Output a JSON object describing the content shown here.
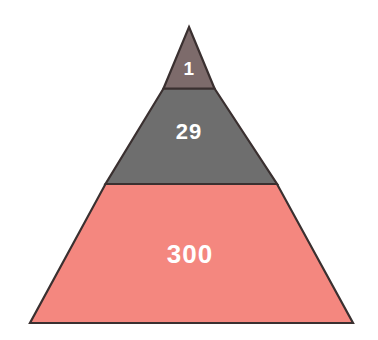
{
  "chart_data": {
    "type": "pie",
    "chart_variant": "pyramid",
    "title": "",
    "subtitle": "",
    "xlabel": "",
    "ylabel": "",
    "legend": [],
    "grid": false,
    "categories": [
      "top",
      "middle",
      "bottom"
    ],
    "values": [
      1,
      29,
      300
    ],
    "labels": [
      "1",
      "29",
      "300"
    ],
    "series": [
      {
        "name": "pyramid_tiers",
        "values": [
          1,
          29,
          300
        ]
      }
    ],
    "tiers": [
      {
        "id": "tier-top",
        "label": "1",
        "value": 1,
        "fill": "#7d6b6b",
        "stroke": "#3a3030",
        "points": "189,27 214.5,88.5 163.5,88.5",
        "label_x": 189,
        "label_y": 70
      },
      {
        "id": "tier-middle",
        "label": "29",
        "value": 29,
        "fill": "#6e6e6e",
        "stroke": "#3a3030",
        "points": "163.5,88.5 214.5,88.5 277,184 105.5,184",
        "label_x": 189,
        "label_y": 133
      },
      {
        "id": "tier-bottom",
        "label": "300",
        "value": 300,
        "fill": "#f4877f",
        "stroke": "#3a3030",
        "points": "105.5,184 277,184 353,323 30,323",
        "label_x": 190,
        "label_y": 256
      }
    ],
    "geometry": {
      "apex_x": 189,
      "apex_y": 27,
      "base_left_x": 30,
      "base_right_x": 353,
      "base_y": 323,
      "divider_1_y": 88.5,
      "divider_2_y": 184
    },
    "colors": {
      "background": "#ffffff",
      "outline": "#3a3030",
      "tier_top": "#7d6b6b",
      "tier_middle": "#6e6e6e",
      "tier_bottom": "#f4877f",
      "label_text": "#ffffff"
    }
  }
}
